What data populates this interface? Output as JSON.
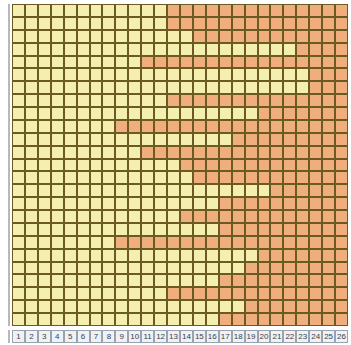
{
  "chart_data": {
    "type": "heatmap",
    "title": "",
    "subtitle": "",
    "xlabel": "",
    "ylabel": "",
    "grid": true,
    "legend": "none",
    "n_columns": 26,
    "n_rows": 25,
    "x_tick_labels": [
      "1",
      "2",
      "3",
      "4",
      "5",
      "6",
      "7",
      "8",
      "9",
      "10",
      "11",
      "12",
      "13",
      "14",
      "15",
      "16",
      "17",
      "18",
      "19",
      "20",
      "21",
      "22",
      "23",
      "24",
      "25",
      "26"
    ],
    "y_tick_labels": [],
    "xlim": [
      1,
      26
    ],
    "ylim": [
      1,
      25
    ],
    "states": [
      {
        "value": 0,
        "name": "pale-yellow",
        "color": "#f4efae"
      },
      {
        "value": 1,
        "name": "orange",
        "color": "#f0ae7c"
      }
    ],
    "cell_border_color": "#6b5a22",
    "axis_cell_fill": "#eef1f5",
    "axis_cell_border": "#9aa3ad",
    "axis_label_color": "#3a3f46",
    "matrix": [
      [
        0,
        0,
        0,
        0,
        0,
        0,
        0,
        0,
        0,
        0,
        0,
        0,
        1,
        1,
        1,
        1,
        1,
        1,
        1,
        1,
        1,
        1,
        1,
        1,
        1,
        1
      ],
      [
        0,
        0,
        0,
        0,
        0,
        0,
        0,
        0,
        0,
        0,
        0,
        0,
        1,
        1,
        1,
        1,
        1,
        1,
        1,
        1,
        1,
        1,
        1,
        1,
        1,
        1
      ],
      [
        0,
        0,
        0,
        0,
        0,
        0,
        0,
        0,
        0,
        0,
        0,
        0,
        0,
        0,
        1,
        1,
        1,
        1,
        1,
        1,
        1,
        1,
        1,
        1,
        1,
        1
      ],
      [
        0,
        0,
        0,
        0,
        0,
        0,
        0,
        0,
        0,
        0,
        0,
        0,
        0,
        0,
        0,
        0,
        0,
        0,
        0,
        0,
        0,
        0,
        1,
        1,
        1,
        1
      ],
      [
        0,
        0,
        0,
        0,
        0,
        0,
        0,
        0,
        0,
        0,
        1,
        1,
        1,
        1,
        1,
        1,
        1,
        1,
        1,
        1,
        1,
        1,
        1,
        1,
        1,
        1
      ],
      [
        0,
        0,
        0,
        0,
        0,
        0,
        0,
        0,
        0,
        0,
        0,
        0,
        0,
        0,
        0,
        0,
        0,
        0,
        0,
        0,
        0,
        0,
        0,
        1,
        1,
        1
      ],
      [
        0,
        0,
        0,
        0,
        0,
        0,
        0,
        0,
        0,
        0,
        0,
        0,
        0,
        0,
        0,
        0,
        0,
        0,
        0,
        0,
        0,
        0,
        0,
        1,
        1,
        1
      ],
      [
        0,
        0,
        0,
        0,
        0,
        0,
        0,
        0,
        0,
        0,
        0,
        0,
        1,
        1,
        1,
        1,
        1,
        1,
        1,
        1,
        1,
        1,
        1,
        1,
        1,
        1
      ],
      [
        0,
        0,
        0,
        0,
        0,
        0,
        0,
        0,
        0,
        0,
        0,
        0,
        0,
        0,
        0,
        0,
        0,
        0,
        0,
        1,
        1,
        1,
        1,
        1,
        1,
        1
      ],
      [
        0,
        0,
        0,
        0,
        0,
        0,
        0,
        0,
        1,
        1,
        1,
        1,
        1,
        1,
        1,
        1,
        1,
        1,
        1,
        1,
        1,
        1,
        1,
        1,
        1,
        1
      ],
      [
        0,
        0,
        0,
        0,
        0,
        0,
        0,
        0,
        0,
        0,
        0,
        0,
        0,
        0,
        0,
        0,
        0,
        1,
        1,
        1,
        1,
        1,
        1,
        1,
        1,
        1
      ],
      [
        0,
        0,
        0,
        0,
        0,
        0,
        0,
        0,
        0,
        0,
        1,
        1,
        1,
        1,
        1,
        1,
        1,
        1,
        1,
        1,
        1,
        1,
        1,
        1,
        1,
        1
      ],
      [
        0,
        0,
        0,
        0,
        0,
        0,
        0,
        0,
        0,
        0,
        0,
        0,
        0,
        1,
        1,
        1,
        1,
        1,
        1,
        1,
        1,
        1,
        1,
        1,
        1,
        1
      ],
      [
        0,
        0,
        0,
        0,
        0,
        0,
        0,
        0,
        0,
        0,
        0,
        0,
        0,
        0,
        1,
        1,
        1,
        1,
        1,
        1,
        1,
        1,
        1,
        1,
        1,
        1
      ],
      [
        0,
        0,
        0,
        0,
        0,
        0,
        0,
        0,
        0,
        0,
        0,
        0,
        0,
        0,
        0,
        0,
        0,
        0,
        0,
        0,
        1,
        1,
        1,
        1,
        1,
        1
      ],
      [
        0,
        0,
        0,
        0,
        0,
        0,
        0,
        0,
        0,
        0,
        0,
        0,
        0,
        0,
        0,
        0,
        1,
        1,
        1,
        1,
        1,
        1,
        1,
        1,
        1,
        1
      ],
      [
        0,
        0,
        0,
        0,
        0,
        0,
        0,
        0,
        0,
        0,
        0,
        0,
        0,
        1,
        1,
        1,
        1,
        1,
        1,
        1,
        1,
        1,
        1,
        1,
        1,
        1
      ],
      [
        0,
        0,
        0,
        0,
        0,
        0,
        0,
        0,
        0,
        0,
        0,
        0,
        0,
        0,
        0,
        0,
        1,
        1,
        1,
        1,
        1,
        1,
        1,
        1,
        1,
        1
      ],
      [
        0,
        0,
        0,
        0,
        0,
        0,
        0,
        0,
        1,
        1,
        1,
        1,
        1,
        1,
        1,
        1,
        1,
        1,
        1,
        1,
        1,
        1,
        1,
        1,
        1,
        1
      ],
      [
        0,
        0,
        0,
        0,
        0,
        0,
        0,
        0,
        0,
        0,
        0,
        0,
        0,
        0,
        0,
        0,
        0,
        0,
        0,
        1,
        1,
        1,
        1,
        1,
        1,
        1
      ],
      [
        0,
        0,
        0,
        0,
        0,
        0,
        0,
        0,
        0,
        0,
        0,
        0,
        0,
        0,
        0,
        0,
        0,
        0,
        1,
        1,
        1,
        1,
        1,
        1,
        1,
        1
      ],
      [
        0,
        0,
        0,
        0,
        0,
        0,
        0,
        0,
        0,
        0,
        0,
        0,
        0,
        0,
        0,
        0,
        1,
        1,
        1,
        1,
        1,
        1,
        1,
        1,
        1,
        1
      ],
      [
        0,
        0,
        0,
        0,
        0,
        0,
        0,
        0,
        0,
        0,
        0,
        0,
        1,
        1,
        1,
        1,
        1,
        1,
        1,
        1,
        1,
        1,
        1,
        1,
        1,
        1
      ],
      [
        0,
        0,
        0,
        0,
        0,
        0,
        0,
        0,
        0,
        0,
        0,
        0,
        0,
        0,
        0,
        0,
        0,
        0,
        1,
        1,
        1,
        1,
        1,
        1,
        1,
        1
      ],
      [
        0,
        0,
        0,
        0,
        0,
        0,
        0,
        0,
        0,
        0,
        0,
        0,
        0,
        0,
        0,
        0,
        1,
        1,
        1,
        1,
        1,
        1,
        1,
        1,
        1,
        1
      ]
    ]
  }
}
